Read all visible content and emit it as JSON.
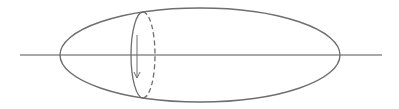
{
  "diagram": {
    "colors": {
      "stroke": "#6e6e6e",
      "axis": "#555555",
      "background": "#ffffff"
    },
    "axis": {
      "x1": 20,
      "y1": 55,
      "x2": 382,
      "y2": 55
    },
    "outer_ellipse": {
      "cx": 200,
      "cy": 55,
      "rx": 140,
      "ry": 47
    },
    "cross_section": {
      "cx": 143,
      "cy": 55,
      "rx": 12,
      "ry": 43,
      "front_half_style": "solid",
      "back_half_style": "dashed"
    },
    "rotation_arrow": {
      "x": 137,
      "y1": 35,
      "y2": 78,
      "direction": "down",
      "icon": "arrow-down-icon"
    }
  }
}
